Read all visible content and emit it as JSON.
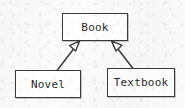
{
  "diagram": {
    "kind": "uml-class-diagram",
    "canvas": {
      "width": 185,
      "height": 108
    },
    "background_color": "#fbfbfb",
    "line_color": "#3a3a3a",
    "fill_color": "#ffffff",
    "text_color": "#2b2b2b",
    "classes": [
      {
        "id": "book",
        "name": "Book",
        "role": "superclass",
        "x": 62,
        "y": 13,
        "width": 66,
        "height": 28
      },
      {
        "id": "novel",
        "name": "Novel",
        "role": "subclass",
        "x": 15,
        "y": 70,
        "width": 66,
        "height": 28
      },
      {
        "id": "textbook",
        "name": "Textbook",
        "role": "subclass",
        "x": 107,
        "y": 68,
        "width": 68,
        "height": 29
      }
    ],
    "relationships": [
      {
        "id": "novel-generalizes-book",
        "type": "generalization",
        "arrowhead": "hollow-triangle",
        "line_style": "solid",
        "from": "novel",
        "to": "book",
        "label": "",
        "from_point": {
          "x": 57,
          "y": 70
        },
        "to_point": {
          "x": 79,
          "y": 41
        }
      },
      {
        "id": "textbook-generalizes-book",
        "type": "generalization",
        "arrowhead": "hollow-triangle",
        "line_style": "solid",
        "from": "textbook",
        "to": "book",
        "label": "",
        "from_point": {
          "x": 133,
          "y": 68
        },
        "to_point": {
          "x": 112,
          "y": 41
        }
      }
    ]
  }
}
